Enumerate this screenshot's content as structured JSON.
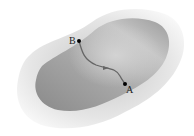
{
  "diagram": {
    "type": "surface-path-diagram",
    "points": [
      {
        "id": "B",
        "label": "B",
        "x": 79,
        "y": 41
      },
      {
        "id": "A",
        "label": "A",
        "x": 125,
        "y": 84
      }
    ],
    "path": {
      "from": "B",
      "to": "A",
      "arrow_direction": "B-to-A"
    },
    "colors": {
      "rim_light": "#f2f2f2",
      "rim_mid": "#d9d9d9",
      "surface_dark": "#8c8c8c",
      "surface_light": "#bdbdbd",
      "path": "#666666",
      "point": "#000000"
    }
  }
}
